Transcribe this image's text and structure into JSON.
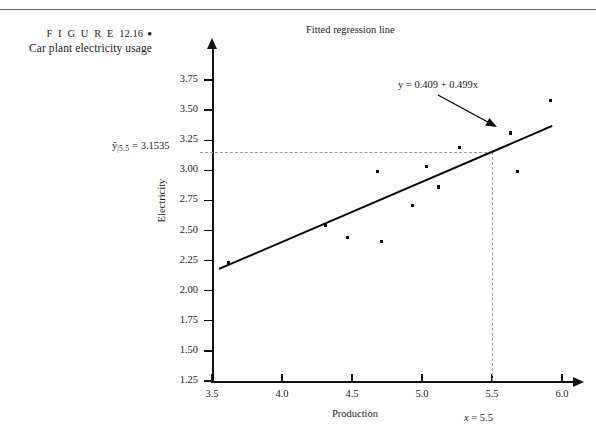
{
  "figure": {
    "label_prefix": "F I G U R E",
    "number": "12.16",
    "bullet": "●",
    "caption": "Car plant electricity usage"
  },
  "chart_data": {
    "type": "scatter",
    "title": "Fitted regression line",
    "xlabel": "Production",
    "ylabel": "Electricity",
    "xlim": [
      3.5,
      6.0
    ],
    "ylim": [
      1.25,
      3.875
    ],
    "xticks": [
      "3.5",
      "4.0",
      "4.5",
      "5.0",
      "5.5",
      "6.0"
    ],
    "xtick_values": [
      3.5,
      4.0,
      4.5,
      5.0,
      5.5,
      6.0
    ],
    "yticks": [
      "1.25",
      "1.50",
      "1.75",
      "2.00",
      "2.25",
      "2.50",
      "2.75",
      "3.00",
      "3.25",
      "3.50",
      "3.75"
    ],
    "ytick_values": [
      1.25,
      1.5,
      1.75,
      2.0,
      2.25,
      2.5,
      2.75,
      3.0,
      3.25,
      3.5,
      3.75
    ],
    "grid": false,
    "legend": null,
    "points": [
      {
        "x": 3.62,
        "y": 2.23
      },
      {
        "x": 4.31,
        "y": 2.54
      },
      {
        "x": 4.47,
        "y": 2.44
      },
      {
        "x": 4.68,
        "y": 2.99
      },
      {
        "x": 4.71,
        "y": 2.41
      },
      {
        "x": 4.93,
        "y": 2.71
      },
      {
        "x": 5.03,
        "y": 3.03
      },
      {
        "x": 5.12,
        "y": 2.86
      },
      {
        "x": 5.27,
        "y": 3.19
      },
      {
        "x": 5.63,
        "y": 3.31
      },
      {
        "x": 5.68,
        "y": 2.99
      },
      {
        "x": 5.92,
        "y": 3.58
      }
    ],
    "fit_line": {
      "equation": "y = 0.409 + 0.499x",
      "intercept": 0.409,
      "slope": 0.499,
      "x_start": 3.55,
      "x_end": 5.93
    },
    "annotations": {
      "equation_label": "y = 0.409 + 0.499x",
      "prediction_label_prefix": "y",
      "prediction_label_sub": "|5.5",
      "prediction_label_value": " = 3.1535",
      "prediction_y": 3.1535,
      "prediction_x": 5.5,
      "x_marker_label_var": "x",
      "x_marker_label_value": " = 5.5"
    }
  }
}
